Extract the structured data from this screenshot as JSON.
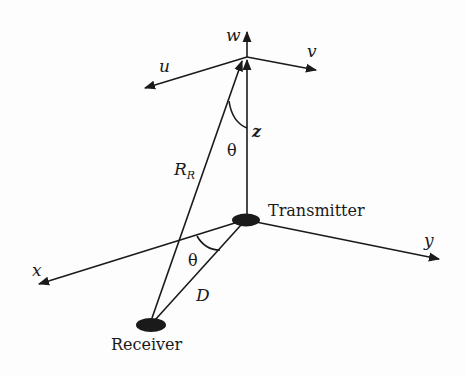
{
  "diagram": {
    "type": "geometry",
    "colors": {
      "ink": "#1a1a1a",
      "background": "#fdfdfd"
    },
    "labels": {
      "w": "w",
      "u": "u",
      "v": "v",
      "z": "z",
      "theta_upper": "θ",
      "R": "R",
      "R_sub": "R",
      "transmitter": "Transmitter",
      "y": "y",
      "x": "x",
      "theta_lower": "θ",
      "D": "D",
      "receiver": "Receiver"
    },
    "nodes": {
      "apex": [
        247,
        57
      ],
      "transmitter": [
        246,
        220
      ],
      "receiver": [
        151,
        325
      ]
    },
    "edges": [
      {
        "name": "w-axis",
        "from": [
          247,
          57
        ],
        "to": [
          247,
          31
        ]
      },
      {
        "name": "u-axis",
        "from": [
          247,
          57
        ],
        "to": [
          144,
          88
        ]
      },
      {
        "name": "v-axis",
        "from": [
          247,
          57
        ],
        "to": [
          316,
          70
        ]
      },
      {
        "name": "z-axis",
        "from": [
          247,
          214
        ],
        "to": [
          247,
          58
        ]
      },
      {
        "name": "R_R-line",
        "from": [
          152,
          318
        ],
        "to": [
          242,
          60
        ]
      },
      {
        "name": "x-axis",
        "from": [
          238,
          222
        ],
        "to": [
          38,
          284
        ]
      },
      {
        "name": "y-axis",
        "from": [
          256,
          222
        ],
        "to": [
          440,
          259
        ]
      },
      {
        "name": "D-line",
        "from": [
          241,
          225
        ],
        "to": [
          156,
          319
        ]
      }
    ]
  }
}
